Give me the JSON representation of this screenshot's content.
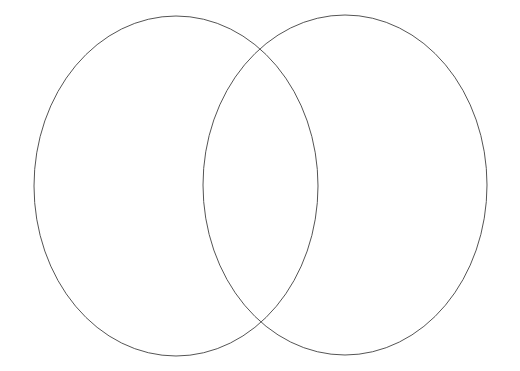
{
  "diagram": {
    "type": "venn",
    "title": "",
    "set_count": 2,
    "background_color": "#ffffff",
    "stroke_color": "#555555",
    "stroke_width": 1,
    "fill": "none",
    "canvas": {
      "width": 520,
      "height": 371
    },
    "shapes": [
      {
        "name": "left-set-ellipse",
        "label": "",
        "cx": 176,
        "cy": 186,
        "rx": 142,
        "ry": 170,
        "stroke": "#555555",
        "fill": "none"
      },
      {
        "name": "right-set-ellipse",
        "label": "",
        "cx": 345,
        "cy": 185,
        "rx": 142,
        "ry": 170,
        "stroke": "#555555",
        "fill": "none"
      }
    ],
    "intersections": [
      {
        "name": "upper-crossing",
        "x": 260,
        "y": 48
      },
      {
        "name": "lower-crossing",
        "x": 260,
        "y": 324
      }
    ],
    "regions": [
      {
        "name": "left-only-region",
        "label": "",
        "cx": 120,
        "cy": 186
      },
      {
        "name": "overlap-region",
        "label": "",
        "cx": 260,
        "cy": 186
      },
      {
        "name": "right-only-region",
        "label": "",
        "cx": 400,
        "cy": 186
      }
    ]
  }
}
